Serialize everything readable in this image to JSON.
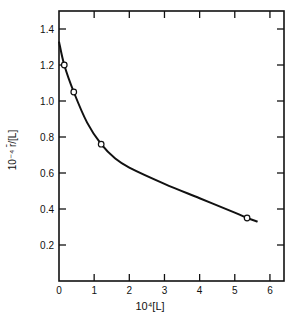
{
  "chart_data": {
    "type": "line",
    "title": "",
    "xlabel": "10⁴[L]",
    "ylabel": "10⁻⁴ r̄/[L]",
    "xlim": [
      0,
      6.4
    ],
    "ylim": [
      0,
      1.5
    ],
    "x_ticks": [
      0,
      1,
      2,
      3,
      4,
      5,
      6
    ],
    "y_ticks": [
      0.2,
      0.4,
      0.6,
      0.8,
      1.0,
      1.2,
      1.4
    ],
    "x_tick_labels": [
      "0",
      "1",
      "2",
      "3",
      "4",
      "5",
      "6"
    ],
    "y_tick_labels": [
      "0.2",
      "0.4",
      "0.6",
      "0.8",
      "1.0",
      "1.2",
      "1.4"
    ],
    "grid": false,
    "series": [
      {
        "name": "measured points",
        "marker": "open-circle",
        "x": [
          0.15,
          0.42,
          1.2,
          5.35
        ],
        "values": [
          1.2,
          1.05,
          0.76,
          0.35
        ]
      },
      {
        "name": "fitted curve",
        "marker": "none",
        "x": [
          0,
          0.15,
          0.42,
          0.8,
          1.2,
          1.6,
          2.0,
          3.0,
          4.0,
          5.0,
          5.35,
          5.65
        ],
        "values": [
          1.33,
          1.2,
          1.05,
          0.88,
          0.76,
          0.68,
          0.63,
          0.54,
          0.46,
          0.38,
          0.35,
          0.33
        ]
      }
    ]
  }
}
